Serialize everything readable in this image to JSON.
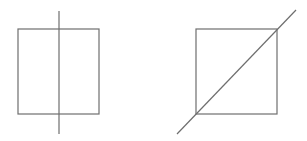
{
  "figures": [
    {
      "name": "square-with-vertical-line",
      "square": {
        "x": 18,
        "y": 29,
        "w": 81,
        "h": 85
      },
      "line": {
        "x1": 59,
        "y1": 11,
        "x2": 59,
        "y2": 134
      }
    },
    {
      "name": "square-with-diagonal-line",
      "square": {
        "x": 196,
        "y": 29,
        "w": 81,
        "h": 85
      },
      "line": {
        "x1": 177,
        "y1": 134,
        "x2": 296,
        "y2": 10
      }
    }
  ],
  "colors": {
    "stroke": "#6e6e6e",
    "background": "#ffffff"
  }
}
